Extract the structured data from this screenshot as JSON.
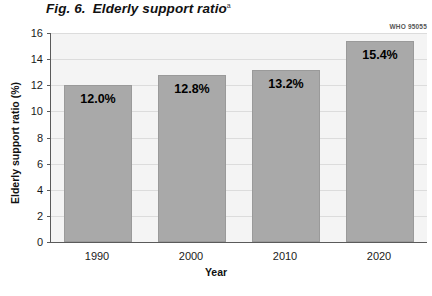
{
  "figure": {
    "number_label": "Fig. 6.",
    "title": "Elderly support ratio",
    "title_footnote_marker": "a",
    "who_code": "WHO 95055"
  },
  "chart_data": {
    "type": "bar",
    "title": "Elderly support ratio",
    "categories": [
      "1990",
      "2000",
      "2010",
      "2020"
    ],
    "values": [
      12.0,
      12.8,
      13.2,
      15.4
    ],
    "value_labels": [
      "12.0%",
      "12.8%",
      "13.2%",
      "15.4%"
    ],
    "xlabel": "Year",
    "ylabel": "Elderly support ratio (%)",
    "ylim": [
      0,
      16
    ],
    "ytick_labels": [
      "0",
      "2",
      "4",
      "6",
      "8",
      "10",
      "12",
      "14",
      "16"
    ],
    "ytick_values": [
      0,
      2,
      4,
      6,
      8,
      10,
      12,
      14,
      16
    ],
    "grid": true,
    "legend": false,
    "bar_color": "#a9a9a9",
    "plot_background": "#f4f4f4",
    "axis_color": "#5a5a5a",
    "gridline_color": "#dcdcdc"
  }
}
